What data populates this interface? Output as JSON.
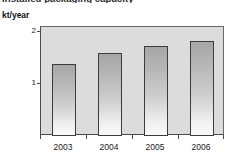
{
  "chart_data": {
    "type": "bar",
    "title": "Installed packaging capacity",
    "title_clipped": true,
    "categories": [
      "2003",
      "2004",
      "2005",
      "2006"
    ],
    "values": [
      1.38,
      1.6,
      1.74,
      1.83
    ],
    "xlabel": "",
    "ylabel": "kt/year",
    "ylim": [
      0,
      2.1
    ],
    "yticks": [
      1,
      2
    ],
    "ytick_labels": [
      "1",
      "2"
    ],
    "grid": false,
    "legend": false,
    "bar_color": "#b4b4b4",
    "bar_edge_color": "#3c3c3c",
    "plot_background": "#dcdcdc",
    "figure_background": "#ffffff"
  }
}
